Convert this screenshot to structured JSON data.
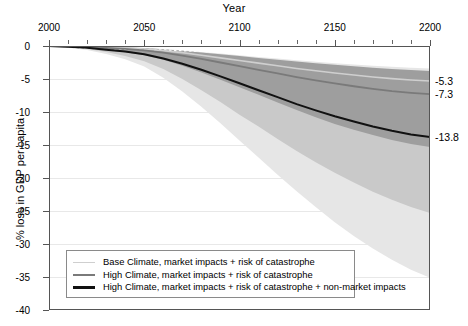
{
  "chart_data": {
    "type": "area",
    "title": "",
    "xlabel": "Year",
    "ylabel": "% loss in GDP per capita",
    "xlim": [
      2000,
      2200
    ],
    "ylim": [
      -40,
      0
    ],
    "x_major_ticks": [
      2000,
      2050,
      2100,
      2150,
      2200
    ],
    "x_minor_step": 10,
    "y_ticks": [
      0,
      -5,
      -10,
      -15,
      -20,
      -25,
      -30,
      -35,
      -40
    ],
    "y_tick_labels": [
      "0",
      "-5",
      "-10",
      "-15",
      "-20",
      "-25",
      "-30",
      "-35",
      "-40"
    ],
    "x_axis_position": "top",
    "grid": true,
    "legend_position": "lower-left-inside",
    "end_labels": [
      {
        "value": -5.3,
        "text": "-5.3"
      },
      {
        "value": -7.3,
        "text": "-7.3"
      },
      {
        "value": -13.8,
        "text": "-13.8"
      }
    ],
    "x": [
      2000,
      2010,
      2020,
      2030,
      2040,
      2050,
      2060,
      2070,
      2080,
      2090,
      2100,
      2110,
      2120,
      2130,
      2140,
      2150,
      2160,
      2170,
      2180,
      2190,
      2200
    ],
    "series": [
      {
        "name": "Base Climate, market impacts + risk of catastrophe",
        "color": "#cfcfcf",
        "width": 1.6,
        "values": [
          0,
          -0.05,
          -0.1,
          -0.2,
          -0.3,
          -0.45,
          -0.7,
          -1.0,
          -1.4,
          -1.8,
          -2.2,
          -2.6,
          -3.0,
          -3.4,
          -3.75,
          -4.1,
          -4.4,
          -4.7,
          -4.95,
          -5.15,
          -5.3
        ]
      },
      {
        "name": "High Climate, market impacts + risk of catastrophe",
        "color": "#7a7a7a",
        "width": 1.8,
        "values": [
          0,
          -0.07,
          -0.15,
          -0.3,
          -0.45,
          -0.65,
          -1.0,
          -1.45,
          -1.95,
          -2.5,
          -3.05,
          -3.6,
          -4.15,
          -4.7,
          -5.2,
          -5.65,
          -6.1,
          -6.5,
          -6.85,
          -7.1,
          -7.3
        ]
      },
      {
        "name": "High Climate, market impacts + risk of catastrophe + non-market impacts",
        "color": "#111111",
        "width": 2.0,
        "values": [
          0,
          -0.12,
          -0.28,
          -0.55,
          -0.85,
          -1.25,
          -1.9,
          -2.7,
          -3.6,
          -4.6,
          -5.65,
          -6.7,
          -7.75,
          -8.8,
          -9.75,
          -10.65,
          -11.45,
          -12.2,
          -12.85,
          -13.4,
          -13.8
        ]
      }
    ],
    "dashed_line": {
      "name": "zero-reference dotted line",
      "color": "#ffffff",
      "style": "dotted",
      "values": [
        -0.3,
        -0.32,
        -0.35,
        -0.4,
        -0.45,
        -0.5,
        -0.6,
        -0.7,
        -0.8,
        -0.9,
        -1.0,
        -1.1,
        -1.2,
        -1.3,
        -1.4,
        -1.5,
        -1.6,
        -1.7,
        -1.8,
        -1.9,
        -2.0
      ]
    },
    "bands": [
      {
        "name": "outer uncertainty band (lightest)",
        "color": "#e6e6e6",
        "upper": [
          0,
          -0.03,
          -0.07,
          -0.12,
          -0.2,
          -0.3,
          -0.45,
          -0.65,
          -0.9,
          -1.15,
          -1.4,
          -1.65,
          -1.9,
          -2.15,
          -2.4,
          -2.6,
          -2.8,
          -3.0,
          -3.15,
          -3.3,
          -3.4
        ],
        "lower": [
          0,
          -0.25,
          -0.6,
          -1.2,
          -2.0,
          -3.1,
          -4.8,
          -6.9,
          -9.2,
          -11.7,
          -14.3,
          -16.9,
          -19.5,
          -22.0,
          -24.4,
          -26.7,
          -28.8,
          -30.7,
          -32.4,
          -33.9,
          -35.1
        ]
      },
      {
        "name": "middle uncertainty band",
        "color": "#c9c9c9",
        "upper": [
          0,
          -0.04,
          -0.09,
          -0.18,
          -0.28,
          -0.4,
          -0.62,
          -0.9,
          -1.2,
          -1.55,
          -1.9,
          -2.25,
          -2.6,
          -2.95,
          -3.25,
          -3.55,
          -3.85,
          -4.1,
          -4.35,
          -4.55,
          -4.7
        ],
        "lower": [
          0,
          -0.2,
          -0.45,
          -0.9,
          -1.5,
          -2.3,
          -3.5,
          -5.0,
          -6.7,
          -8.5,
          -10.4,
          -12.2,
          -14.1,
          -15.9,
          -17.6,
          -19.2,
          -20.7,
          -22.1,
          -23.3,
          -24.4,
          -25.3
        ]
      },
      {
        "name": "inner uncertainty band (darkest)",
        "color": "#9e9e9e",
        "upper": [
          0,
          -0.03,
          -0.07,
          -0.14,
          -0.22,
          -0.32,
          -0.5,
          -0.72,
          -0.98,
          -1.25,
          -1.52,
          -1.8,
          -2.08,
          -2.35,
          -2.6,
          -2.85,
          -3.08,
          -3.3,
          -3.5,
          -3.65,
          -3.8
        ],
        "lower": [
          0,
          -0.13,
          -0.3,
          -0.6,
          -0.95,
          -1.4,
          -2.1,
          -3.0,
          -4.0,
          -5.1,
          -6.25,
          -7.4,
          -8.55,
          -9.7,
          -10.8,
          -11.8,
          -12.7,
          -13.5,
          -14.25,
          -14.85,
          -15.3
        ]
      }
    ],
    "legend": [
      {
        "label": "Base Climate, market impacts + risk of catastrophe",
        "color": "#cfcfcf",
        "width": 1.6
      },
      {
        "label": "High Climate, market impacts + risk of catastrophe",
        "color": "#7a7a7a",
        "width": 2.0
      },
      {
        "label": "High Climate, market impacts + risk of catastrophe + non-market impacts",
        "color": "#111111",
        "width": 2.6
      }
    ]
  }
}
